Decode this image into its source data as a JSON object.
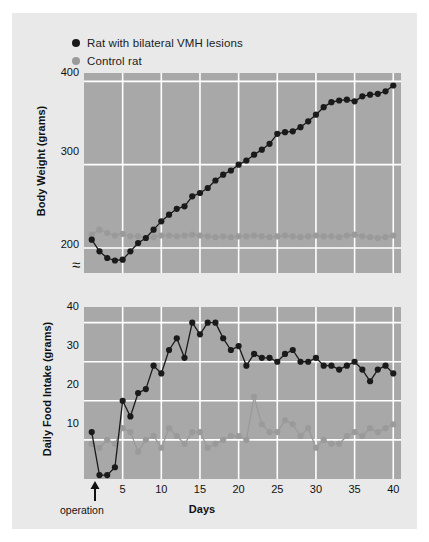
{
  "legend": {
    "items": [
      {
        "label": "Rat with bilateral VMH lesions",
        "color": "#1a1a1a",
        "key": "lesion"
      },
      {
        "label": "Control rat",
        "color": "#9a9a9a",
        "key": "control"
      }
    ]
  },
  "annotations": {
    "operation_label": "operation",
    "break_symbol": "≈"
  },
  "colors": {
    "panel_background": "#e9e9e9",
    "plot_background": "#a8a8a8",
    "gridline": "#ffffff",
    "lesion_series": "#1a1a1a",
    "control_series": "#9a9a9a",
    "text": "#111111"
  },
  "chart_data": [
    {
      "type": "line",
      "id": "body-weight",
      "title": "",
      "xlabel": "",
      "ylabel": "Body Weight (grams)",
      "xlim": [
        0,
        41
      ],
      "ylim": [
        170,
        410
      ],
      "xticks": [
        5,
        10,
        15,
        20,
        25,
        30,
        35,
        40
      ],
      "yticks": [
        200,
        300,
        400
      ],
      "ytick_labels": [
        "200",
        "300",
        "400"
      ],
      "grid": true,
      "y_axis_break": true,
      "legend_position": "above-plot",
      "x": [
        1,
        2,
        3,
        4,
        5,
        6,
        7,
        8,
        9,
        10,
        11,
        12,
        13,
        14,
        15,
        16,
        17,
        18,
        19,
        20,
        21,
        22,
        23,
        24,
        25,
        26,
        27,
        28,
        29,
        30,
        31,
        32,
        33,
        34,
        35,
        36,
        37,
        38,
        39,
        40
      ],
      "series": [
        {
          "name": "Rat with bilateral VMH lesions",
          "color": "#1a1a1a",
          "values": [
            210,
            196,
            188,
            185,
            186,
            196,
            206,
            212,
            222,
            232,
            240,
            247,
            250,
            262,
            266,
            272,
            281,
            288,
            293,
            300,
            305,
            312,
            318,
            325,
            337,
            339,
            340,
            345,
            352,
            360,
            369,
            375,
            377,
            378,
            376,
            382,
            384,
            385,
            388,
            395
          ]
        },
        {
          "name": "Control rat",
          "color": "#9a9a9a",
          "values": [
            216,
            222,
            218,
            215,
            217,
            214,
            214,
            212,
            213,
            215,
            215,
            214,
            215,
            216,
            215,
            214,
            213,
            214,
            213,
            214,
            214,
            215,
            214,
            213,
            214,
            215,
            214,
            213,
            214,
            215,
            214,
            214,
            213,
            215,
            216,
            214,
            213,
            212,
            213,
            215
          ]
        }
      ]
    },
    {
      "type": "line",
      "id": "food-intake",
      "title": "",
      "xlabel": "Days",
      "ylabel": "Daily Food Intake (grams)",
      "xlim": [
        0,
        41
      ],
      "ylim": [
        0,
        44
      ],
      "xticks": [
        5,
        10,
        15,
        20,
        25,
        30,
        35,
        40
      ],
      "xtick_labels": [
        "5",
        "10",
        "15",
        "20",
        "25",
        "30",
        "35",
        "40"
      ],
      "yticks": [
        10,
        20,
        30,
        40
      ],
      "ytick_labels": [
        "10",
        "20",
        "30",
        "40"
      ],
      "grid": true,
      "operation_day": 2,
      "x": [
        1,
        2,
        3,
        4,
        5,
        6,
        7,
        8,
        9,
        10,
        11,
        12,
        13,
        14,
        15,
        16,
        17,
        18,
        19,
        20,
        21,
        22,
        23,
        24,
        25,
        26,
        27,
        28,
        29,
        30,
        31,
        32,
        33,
        34,
        35,
        36,
        37,
        38,
        39,
        40
      ],
      "series": [
        {
          "name": "Rat with bilateral VMH lesions",
          "color": "#1a1a1a",
          "values": [
            12,
            1,
            1,
            3,
            20,
            16,
            22,
            23,
            29,
            27,
            33,
            36,
            31,
            40,
            37,
            40,
            40,
            36,
            33,
            34,
            29,
            32,
            31,
            31,
            30,
            32,
            33,
            30,
            30,
            31,
            29,
            29,
            28,
            29,
            30,
            28,
            25,
            28,
            29,
            27
          ]
        },
        {
          "name": "Control rat",
          "color": "#9a9a9a",
          "values": [
            9,
            8,
            10,
            9,
            13,
            12,
            7,
            10,
            11,
            8,
            13,
            11,
            9,
            12,
            12,
            8,
            9,
            10,
            11,
            11,
            10,
            21,
            14,
            12,
            12,
            15,
            14,
            11,
            13,
            8,
            10,
            9,
            9,
            11,
            12,
            11,
            13,
            12,
            13,
            14
          ]
        }
      ]
    }
  ]
}
